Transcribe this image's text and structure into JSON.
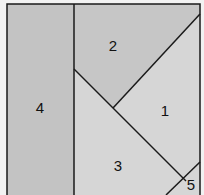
{
  "diagram": {
    "type": "region-partition",
    "colors": {
      "background": "#f2f2f2",
      "dark_region": "#c3c3c3",
      "light_region": "#d6d6d6",
      "line": "#1a1a1a"
    },
    "regions": [
      {
        "id": "1",
        "label": "1",
        "shade": "light"
      },
      {
        "id": "2",
        "label": "2",
        "shade": "dark"
      },
      {
        "id": "3",
        "label": "3",
        "shade": "light"
      },
      {
        "id": "4",
        "label": "4",
        "shade": "dark"
      },
      {
        "id": "5",
        "label": "5",
        "shade": "light"
      }
    ]
  }
}
